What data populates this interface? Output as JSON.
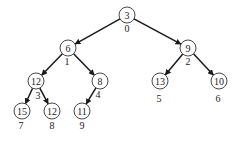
{
  "diagram": {
    "type": "binary-heap-tree",
    "colors": {
      "edge": "#1a1a1a",
      "node_stroke": "#333333",
      "text": "#222222",
      "background": "#ffffff"
    },
    "nodes": [
      {
        "index": "0",
        "value": "3",
        "x": 127,
        "y": 15,
        "ix": 127,
        "iy": 28
      },
      {
        "index": "1",
        "value": "6",
        "x": 68,
        "y": 48,
        "ix": 67,
        "iy": 61
      },
      {
        "index": "2",
        "value": "9",
        "x": 188,
        "y": 48,
        "ix": 188,
        "iy": 61
      },
      {
        "index": "3",
        "value": "12",
        "x": 36,
        "y": 81,
        "ix": 38,
        "iy": 95
      },
      {
        "index": "4",
        "value": "8",
        "x": 100,
        "y": 81,
        "ix": 98,
        "iy": 94
      },
      {
        "index": "5",
        "value": "13",
        "x": 160,
        "y": 81,
        "ix": 159,
        "iy": 98
      },
      {
        "index": "6",
        "value": "10",
        "x": 219,
        "y": 81,
        "ix": 218,
        "iy": 98
      },
      {
        "index": "7",
        "value": "15",
        "x": 22,
        "y": 111,
        "ix": 21,
        "iy": 125
      },
      {
        "index": "8",
        "value": "12",
        "x": 52,
        "y": 111,
        "ix": 52,
        "iy": 125
      },
      {
        "index": "9",
        "value": "11",
        "x": 82,
        "y": 111,
        "ix": 82,
        "iy": 125
      }
    ],
    "edges": [
      {
        "from": 0,
        "to": 1
      },
      {
        "from": 0,
        "to": 2
      },
      {
        "from": 1,
        "to": 3
      },
      {
        "from": 1,
        "to": 4
      },
      {
        "from": 2,
        "to": 5
      },
      {
        "from": 2,
        "to": 6
      },
      {
        "from": 3,
        "to": 7
      },
      {
        "from": 3,
        "to": 8
      },
      {
        "from": 4,
        "to": 9
      }
    ]
  }
}
